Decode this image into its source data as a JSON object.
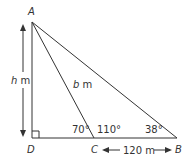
{
  "diagram": {
    "points": {
      "A": {
        "label": "A"
      },
      "B": {
        "label": "B"
      },
      "C": {
        "label": "C"
      },
      "D": {
        "label": "D"
      }
    },
    "measurements": {
      "height_label_var": "h",
      "height_label_unit": " m",
      "hyp_label_var": "b",
      "hyp_label_unit": " m",
      "base_label": "120 m"
    },
    "angles": {
      "ACD": "70°",
      "ACB": "110°",
      "ABC": "38°"
    },
    "colors": {
      "line": "#333333",
      "background": "#ffffff"
    }
  }
}
